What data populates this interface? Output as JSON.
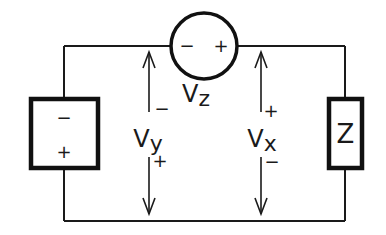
{
  "diagram": {
    "type": "circuit",
    "components": {
      "left_source": {
        "kind": "voltage-source-box",
        "top_polarity": "−",
        "bottom_polarity": "+"
      },
      "top_source": {
        "kind": "voltage-source-circle",
        "left_polarity": "−",
        "right_polarity": "+",
        "label_main": "V",
        "label_sub": "z"
      },
      "right_load": {
        "kind": "impedance",
        "label": "Z"
      }
    },
    "measurements": {
      "vy": {
        "label_main": "V",
        "label_sub": "y",
        "top_polarity": "−",
        "bottom_polarity": "+"
      },
      "vx": {
        "label_main": "V",
        "label_sub": "x",
        "top_polarity": "+",
        "bottom_polarity": "−"
      }
    },
    "colors": {
      "line": "#1a1a1a",
      "background": "#ffffff"
    }
  }
}
